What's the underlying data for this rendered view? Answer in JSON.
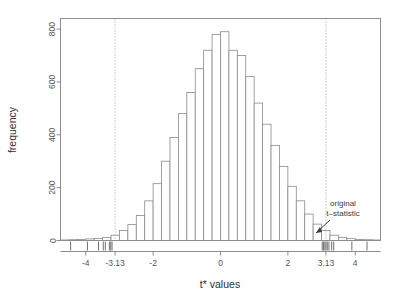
{
  "chart_data": {
    "type": "bar",
    "subtype": "histogram",
    "title": "",
    "xlabel": "t* values",
    "ylabel": "frequency",
    "xlim": [
      -4.75,
      4.75
    ],
    "ylim": [
      0,
      840
    ],
    "bin_width": 0.25,
    "grid": false,
    "legend": null,
    "xticks": [
      -4,
      -3.13,
      -2,
      0,
      2,
      3.13,
      4
    ],
    "xtick_labels": [
      "-4",
      "-3.13",
      "-2",
      "0",
      "2",
      "3.13",
      "4"
    ],
    "yticks": [
      0,
      200,
      400,
      600,
      800
    ],
    "ytick_labels": [
      "0",
      "200",
      "400",
      "600",
      "800"
    ],
    "bin_edges": [
      -4.75,
      -4.5,
      -4.25,
      -4,
      -3.75,
      -3.5,
      -3.25,
      -3,
      -2.75,
      -2.5,
      -2.25,
      -2,
      -1.75,
      -1.5,
      -1.25,
      -1,
      -0.75,
      -0.5,
      -0.25,
      0,
      0.25,
      0.5,
      0.75,
      1,
      1.25,
      1.5,
      1.75,
      2,
      2.25,
      2.5,
      2.75,
      3,
      3.25,
      3.5,
      3.75,
      4,
      4.25,
      4.5,
      4.75
    ],
    "bin_centers": [
      -4.625,
      -4.375,
      -4.125,
      -3.875,
      -3.625,
      -3.375,
      -3.125,
      -2.875,
      -2.625,
      -2.375,
      -2.125,
      -1.875,
      -1.625,
      -1.375,
      -1.125,
      -0.875,
      -0.625,
      -0.375,
      -0.125,
      0.125,
      0.375,
      0.625,
      0.875,
      1.125,
      1.375,
      1.625,
      1.875,
      2.125,
      2.375,
      2.625,
      2.875,
      3.125,
      3.375,
      3.625,
      3.875,
      4.125,
      4.375,
      4.625
    ],
    "values": [
      2,
      3,
      4,
      6,
      8,
      12,
      20,
      38,
      60,
      95,
      150,
      215,
      300,
      390,
      480,
      560,
      650,
      720,
      780,
      790,
      720,
      700,
      620,
      520,
      440,
      360,
      280,
      205,
      150,
      100,
      62,
      38,
      20,
      12,
      7,
      4,
      3,
      2
    ],
    "reference_lines": [
      {
        "x": -3.13,
        "style": "dotted",
        "label": "-3.13"
      },
      {
        "x": 3.13,
        "style": "dotted",
        "label": "3.13"
      }
    ],
    "annotations": [
      {
        "text_line1": "original",
        "text_line2": "t–statistic",
        "points_to_x": 3.13,
        "points_to_y": 0
      }
    ],
    "rug_values": [
      -4.45,
      -3.95,
      -3.62,
      -3.48,
      -3.42,
      -3.3,
      -3.26,
      -3.22,
      3.02,
      3.06,
      3.1,
      3.13,
      3.17,
      3.22,
      3.3,
      3.36,
      3.9,
      4.35
    ]
  },
  "colors": {
    "background": "#ffffff",
    "axis": "#707070",
    "bar_outline": "#8a8a8a",
    "bar_fill": "#ffffff",
    "reference_line": "#9a9a9a",
    "text": "#3a3a3a",
    "tick_text": "#555555",
    "annotation": "#3a3a3a"
  }
}
